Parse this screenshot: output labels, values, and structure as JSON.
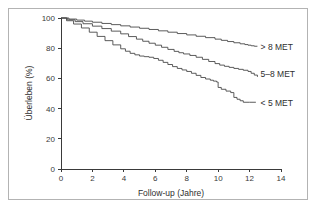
{
  "chart_data": {
    "type": "line",
    "title": "",
    "xlabel": "Follow-up (Jahre)",
    "ylabel": "Überleben (%)",
    "xlim": [
      0,
      14
    ],
    "ylim": [
      0,
      100
    ],
    "xticks": [
      0,
      2,
      4,
      6,
      8,
      10,
      12,
      14
    ],
    "yticks": [
      0,
      20,
      40,
      60,
      80,
      100
    ],
    "grid": false,
    "legend_position": "right-inline",
    "series": [
      {
        "name": "> 8 MET",
        "label": "> 8 MET",
        "label_x": 12.7,
        "label_y": 81,
        "x": [
          0,
          0.5,
          1.0,
          1.5,
          2.0,
          2.6,
          3.2,
          3.8,
          4.4,
          5.0,
          5.6,
          6.2,
          6.8,
          7.4,
          8.0,
          8.6,
          9.2,
          9.8,
          10.2,
          10.6,
          11.0,
          11.4,
          11.7,
          11.9,
          12.1,
          12.3,
          12.5
        ],
        "y": [
          100,
          99.3,
          98.6,
          97.9,
          97.2,
          96.4,
          95.6,
          94.8,
          94.0,
          93.2,
          92.4,
          91.5,
          90.6,
          89.7,
          88.8,
          87.9,
          87.0,
          86.0,
          85.2,
          84.4,
          83.6,
          82.9,
          82.4,
          82.0,
          81.6,
          81.3,
          81.3
        ]
      },
      {
        "name": "5-8 MET",
        "label": "5–8 MET",
        "label_x": 12.7,
        "label_y": 63,
        "x": [
          0,
          0.4,
          0.9,
          1.4,
          2.0,
          2.6,
          3.2,
          3.8,
          4.3,
          4.8,
          5.2,
          5.6,
          6.0,
          6.4,
          6.8,
          7.2,
          7.5,
          7.8,
          8.2,
          8.6,
          9.0,
          9.4,
          9.8,
          10.1,
          10.4,
          10.7,
          11.0,
          11.3,
          11.6,
          11.9,
          12.1,
          12.3,
          12.5
        ],
        "y": [
          100,
          98.8,
          97.6,
          96.2,
          94.6,
          93.0,
          91.3,
          89.5,
          87.7,
          86.0,
          84.6,
          83.3,
          82.0,
          80.6,
          79.2,
          77.9,
          77.0,
          76.2,
          75.2,
          74.0,
          72.6,
          71.2,
          69.8,
          68.8,
          68.0,
          67.3,
          66.6,
          66.0,
          65.4,
          64.6,
          63.4,
          62.2,
          61.0
        ]
      },
      {
        "name": "< 5 MET",
        "label": "< 5 MET",
        "label_x": 12.7,
        "label_y": 44,
        "x": [
          0,
          0.35,
          0.8,
          1.3,
          1.8,
          2.3,
          2.8,
          3.3,
          3.8,
          4.1,
          4.4,
          4.7,
          5.0,
          5.3,
          5.6,
          5.9,
          6.2,
          6.5,
          6.8,
          7.1,
          7.4,
          7.7,
          8.0,
          8.3,
          8.6,
          8.9,
          9.2,
          9.5,
          9.7,
          9.9,
          10.0,
          10.2,
          10.5,
          10.8,
          11.0,
          11.2,
          11.4,
          11.6,
          12.0,
          12.4
        ],
        "y": [
          100,
          98.2,
          96.0,
          93.4,
          90.6,
          87.8,
          85.0,
          82.2,
          79.6,
          78.0,
          76.6,
          75.6,
          74.8,
          74.4,
          74.0,
          73.2,
          72.0,
          70.6,
          69.2,
          67.8,
          66.6,
          65.6,
          64.6,
          63.4,
          62.0,
          60.6,
          59.6,
          58.8,
          58.2,
          57.6,
          54.0,
          52.8,
          51.6,
          50.6,
          47.4,
          46.2,
          45.2,
          44.2,
          44.2,
          44.2
        ]
      }
    ]
  },
  "figure": {
    "background_color": "#ffffff",
    "frame_color": "#b3b3b3",
    "axis_color": "#3a3a3a",
    "curve_color": "#4a4a4a"
  }
}
